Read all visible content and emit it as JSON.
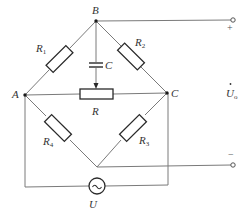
{
  "diagram": {
    "type": "bridge-circuit",
    "nodes": {
      "A": {
        "label": "A"
      },
      "B": {
        "label": "B"
      },
      "C": {
        "label": "C"
      }
    },
    "components": {
      "R1": {
        "symbol": "R",
        "subscript": "1"
      },
      "R2": {
        "symbol": "R",
        "subscript": "2"
      },
      "R3": {
        "symbol": "R",
        "subscript": "3"
      },
      "R4": {
        "symbol": "R",
        "subscript": "4"
      },
      "R": {
        "symbol": "R",
        "subscript": ""
      },
      "C": {
        "symbol": "C",
        "subscript": ""
      },
      "source": {
        "symbol": "U",
        "glyph": "~"
      }
    },
    "output": {
      "symbol": "U",
      "dot": "•",
      "subscript": "o",
      "plus": "+",
      "minus": "−"
    }
  }
}
